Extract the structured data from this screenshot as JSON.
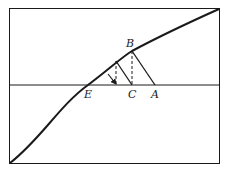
{
  "diagram": {
    "type": "curve-iteration",
    "colors": {
      "ink": "#1a1a1a",
      "background": "#ffffff"
    },
    "frame": {
      "x": 9.5,
      "y": 8.5,
      "width": 210,
      "height": 155
    },
    "axis_line_y": 85,
    "curve_path": "M10,163 C40,140 60,105 88,85 C108,70 122,57 132,51 C160,36 190,22 219,9",
    "labels": [
      {
        "id": "B",
        "text": "B",
        "x": 126,
        "y": 47
      },
      {
        "id": "E",
        "text": "E",
        "x": 84,
        "y": 98
      },
      {
        "id": "C",
        "text": "C",
        "x": 128,
        "y": 98
      },
      {
        "id": "A",
        "text": "A",
        "x": 151,
        "y": 98
      }
    ],
    "points": {
      "B": [
        132,
        51
      ],
      "P2": [
        116,
        61
      ],
      "C": [
        132,
        85
      ],
      "A": [
        155,
        85
      ],
      "P2foot": [
        116,
        85
      ],
      "E": [
        88,
        85
      ]
    }
  }
}
